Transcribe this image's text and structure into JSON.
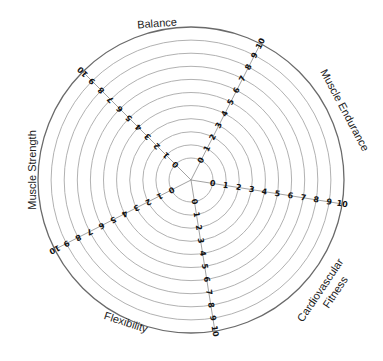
{
  "chart_data": {
    "type": "radar",
    "title": "",
    "categories": [
      "Balance",
      "Muscle Endurance",
      "Cardiovascular Fitness",
      "Flexibility",
      "Muscle Strength"
    ],
    "axes": [
      {
        "name": "Muscle Endurance",
        "angle_deg": 27,
        "ticks": [
          0,
          1,
          2,
          3,
          4,
          5,
          6,
          7,
          8,
          9,
          10
        ]
      },
      {
        "name": "Cardiovascular Fitness",
        "angle_deg": 99,
        "ticks": [
          0,
          1,
          2,
          3,
          4,
          5,
          6,
          7,
          8,
          9,
          10
        ]
      },
      {
        "name": "Flexibility",
        "angle_deg": 171,
        "ticks": [
          0,
          1,
          2,
          3,
          4,
          5,
          6,
          7,
          8,
          9,
          10
        ]
      },
      {
        "name": "Muscle Strength",
        "angle_deg": 243,
        "ticks": [
          0,
          1,
          2,
          3,
          4,
          5,
          6,
          7,
          8,
          9,
          10
        ]
      },
      {
        "name": "Balance",
        "angle_deg": 315,
        "ticks": [
          0,
          1,
          2,
          3,
          4,
          5,
          6,
          7,
          8,
          9,
          10
        ]
      }
    ],
    "range": [
      0,
      10
    ],
    "grid": true,
    "series": [],
    "labels": [
      {
        "text": "Balance",
        "x": 157,
        "y": 23,
        "rotate": -4
      },
      {
        "text": "Muscle Endurance",
        "x": 345,
        "y": 110,
        "rotate": 62
      },
      {
        "text": "Cardiovascular",
        "x": 320,
        "y": 290,
        "rotate": -56
      },
      {
        "text": "Fitness",
        "x": 335,
        "y": 292,
        "rotate": -56
      },
      {
        "text": "Flexibility",
        "x": 126,
        "y": 322,
        "rotate": 18
      },
      {
        "text": "Muscle Strength",
        "x": 32,
        "y": 170,
        "rotate": -90
      }
    ]
  },
  "geometry": {
    "cx": 191,
    "cy": 180,
    "r0": 22,
    "r10": 153,
    "ring_color": "#a8a8a8",
    "outer_color": "#6a6a6a"
  }
}
